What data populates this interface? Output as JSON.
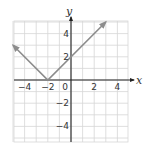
{
  "chart_data": {
    "type": "line",
    "title": "",
    "function": "y = |x + 2|",
    "xlabel": "x",
    "ylabel": "y",
    "xlim": [
      -5,
      5
    ],
    "ylim": [
      -5,
      5
    ],
    "grid": true,
    "x_ticks": [
      -4,
      -2,
      0,
      2,
      4
    ],
    "y_ticks": [
      4,
      2,
      -2,
      -4
    ],
    "x_tick_labels": [
      "−4",
      "−2",
      "0",
      "2",
      "4"
    ],
    "y_tick_labels": [
      "4",
      "2",
      "−2",
      "−4"
    ],
    "series": [
      {
        "name": "V-graph",
        "points": [
          [
            -5,
            3
          ],
          [
            -2,
            0
          ],
          [
            3,
            5
          ]
        ],
        "arrows_at_ends": true,
        "color": "#8c8c8c"
      }
    ]
  },
  "colors": {
    "grid": "#d6d6d6",
    "axis": "#222222",
    "curve": "#8c8c8c"
  }
}
